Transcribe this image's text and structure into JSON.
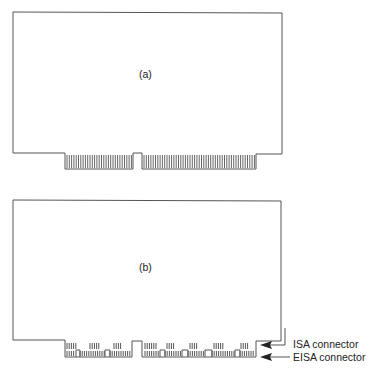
{
  "figure": {
    "panel_a": {
      "label": "(a)"
    },
    "panel_b": {
      "label": "(b)"
    },
    "annotations": {
      "isa": "ISA connector",
      "eisa": "EISA connector"
    }
  }
}
